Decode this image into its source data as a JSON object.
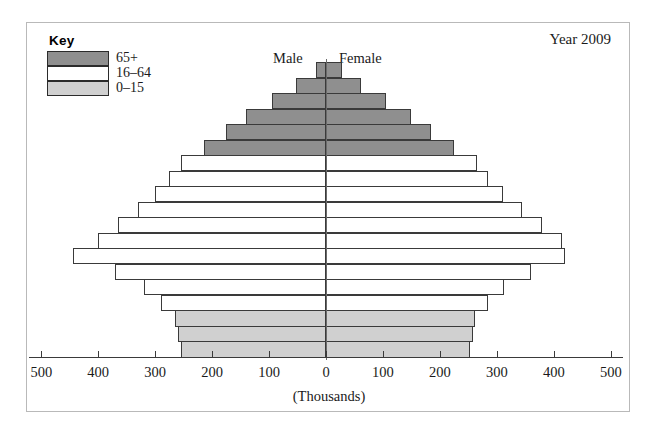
{
  "figure": {
    "year_label": "Year 2009",
    "male_label": "Male",
    "female_label": "Female",
    "axis_title": "(Thousands)"
  },
  "legend": {
    "title": "Key",
    "items": [
      {
        "label": "65+",
        "color": "#8f8f8f"
      },
      {
        "label": "16–64",
        "color": "#ffffff"
      },
      {
        "label": "0–15",
        "color": "#d0d0d0"
      }
    ]
  },
  "colors": {
    "age_65_plus": "#8f8f8f",
    "age_16_64": "#ffffff",
    "age_0_15": "#d0d0d0",
    "bar_outline": "#3a3a3a",
    "axis": "#3a3a3a",
    "frame": "#b9b9b9",
    "centerline": "#6a6a6a"
  },
  "chart_data": {
    "type": "bar",
    "title": "Year 2009",
    "subtitle": "",
    "xlabel": "(Thousands)",
    "ylabel": "",
    "orientation": "horizontal",
    "layout": "population-pyramid",
    "xlim": [
      -500,
      500
    ],
    "xticks": [
      500,
      400,
      300,
      200,
      100,
      0,
      100,
      200,
      300,
      400,
      500
    ],
    "xtick_labels": [
      "500",
      "400",
      "300",
      "200",
      "100",
      "0",
      "100",
      "200",
      "300",
      "400",
      "500"
    ],
    "grid": false,
    "legend_position": "top-left",
    "units": "thousands",
    "categories": [
      "90+",
      "85-89",
      "80-84",
      "75-79",
      "70-74",
      "65-69",
      "60-64",
      "55-59",
      "50-54",
      "45-49",
      "40-44",
      "35-39",
      "30-34",
      "25-29",
      "20-24",
      "15-19",
      "10-14",
      "5-9",
      "0-4"
    ],
    "series": [
      {
        "name": "Male",
        "side": "left",
        "values": [
          18,
          52,
          95,
          140,
          175,
          215,
          255,
          275,
          300,
          330,
          365,
          400,
          445,
          370,
          320,
          290,
          265,
          260,
          255
        ]
      },
      {
        "name": "Female",
        "side": "right",
        "values": [
          28,
          62,
          105,
          150,
          185,
          225,
          265,
          285,
          310,
          345,
          380,
          415,
          420,
          360,
          312,
          285,
          262,
          258,
          252
        ]
      }
    ],
    "group_colors": {
      "65+": [
        "90+",
        "85-89",
        "80-84",
        "75-79",
        "70-74",
        "65-69"
      ],
      "16-64": [
        "60-64",
        "55-59",
        "50-54",
        "45-49",
        "40-44",
        "35-39",
        "30-34",
        "25-29",
        "20-24",
        "15-19"
      ],
      "0-15": [
        "10-14",
        "5-9",
        "0-4"
      ]
    }
  }
}
